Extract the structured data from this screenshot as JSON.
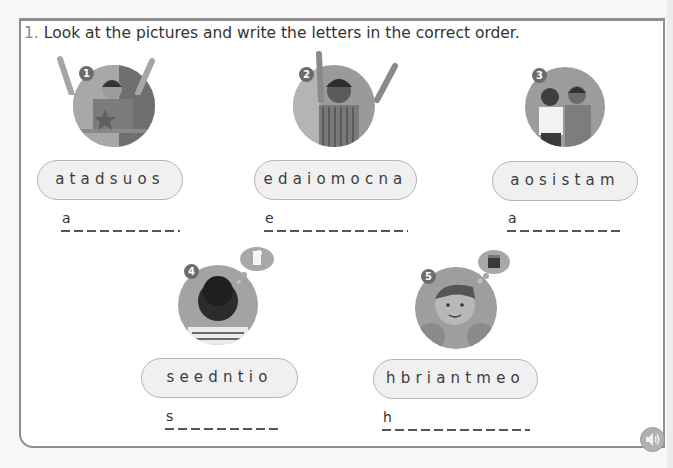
{
  "exercise": {
    "number": "1.",
    "instruction": "Look at the pictures and write the letters in the correct order."
  },
  "items": [
    {
      "number": "1",
      "scrambled": "atadsuos",
      "first_letter": "a",
      "blanks": 9,
      "picture": "scared-boy-on-ride"
    },
    {
      "number": "2",
      "scrambled": "edaiomocna",
      "first_letter": "e",
      "blanks": 11,
      "picture": "excited-girl-on-ride"
    },
    {
      "number": "3",
      "scrambled": "aosistam",
      "first_letter": "a",
      "blanks": 9,
      "picture": "two-friends-together"
    },
    {
      "number": "4",
      "scrambled": "seedntio",
      "first_letter": "s",
      "blanks": 9,
      "picture": "thirsty-boy-thinking-of-drink"
    },
    {
      "number": "5",
      "scrambled": "hbriantmeo",
      "first_letter": "h",
      "blanks": 11,
      "picture": "hungry-boy-thinking-of-food"
    }
  ],
  "audio": {
    "icon": "speaker-icon"
  },
  "colors": {
    "frame_border": "#8e8e8e",
    "pill_fill": "#f0f0f0",
    "pill_border": "#b5b5b5",
    "badge": "#6b6b6b"
  }
}
